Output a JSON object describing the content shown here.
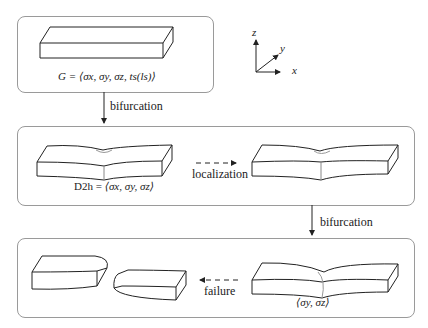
{
  "diagram": {
    "axes": {
      "z": "z",
      "y": "y",
      "x": "x"
    },
    "stages": [
      {
        "id": "initial",
        "formula_prefix": "G = ",
        "formula": "⟨σx, σy, σz, ts(ls)⟩"
      },
      {
        "id": "localized-neck",
        "formula_prefix": "D2h = ",
        "formula": "⟨σx, σy, σz⟩"
      },
      {
        "id": "shear-neck",
        "formula": "⟨σy, σz⟩"
      }
    ],
    "transitions": {
      "bifurcation_1": "bifurcation",
      "localization": "localization",
      "bifurcation_2": "bifurcation",
      "failure": "failure"
    },
    "colors": {
      "line": "#222222",
      "panel_border": "#9a9a9a",
      "background": "#ffffff"
    }
  }
}
